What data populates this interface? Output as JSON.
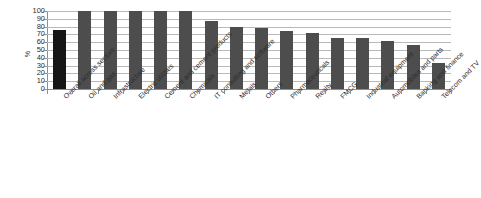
{
  "chart_data": {
    "type": "bar",
    "title": "",
    "subtitle": "",
    "xlabel": "",
    "ylabel": "%",
    "ylim": [
      0,
      100
    ],
    "y_ticks": [
      0,
      10,
      20,
      30,
      40,
      50,
      60,
      70,
      80,
      90,
      100
    ],
    "grid": true,
    "legend": "none",
    "orientation": "vertical",
    "label_rotation": -45,
    "categories": [
      "Overall across sectors",
      "Oil and gas",
      "Infrastructure",
      "Electric utilities",
      "Cement and cement products",
      "Chemicals",
      "IT consulting and software",
      "Metals",
      "Others",
      "Pharmaceuticals",
      "Realty",
      "FMCG",
      "Industrial equipment",
      "Automobiles and parts",
      "Banking and finance",
      "Telecom and TV"
    ],
    "values": [
      76,
      100,
      100,
      100,
      100,
      100,
      87,
      79,
      78,
      75,
      72,
      66,
      65,
      62,
      56,
      33
    ],
    "highlight_index": 0,
    "colors": {
      "bar": "#4d4d4d",
      "bar_highlight": "#171717",
      "gridline": "#b9b9b9",
      "axis": "#8e8e8e",
      "text": "#2c2c2c",
      "background": "#ffffff"
    }
  }
}
